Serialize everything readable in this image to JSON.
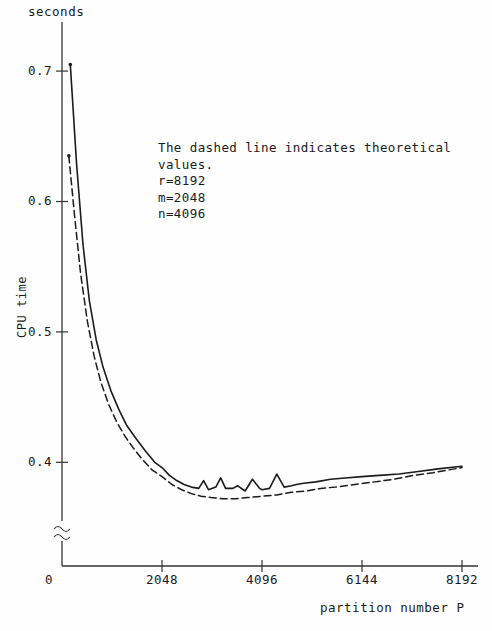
{
  "figure": {
    "units_label": "seconds",
    "ylabel": "CPU time",
    "xlabel": "partition number P",
    "annotation_lines": [
      "The dashed line indicates theoretical",
      "values.",
      "r=8192",
      "m=2048",
      "n=4096"
    ],
    "axis_break_symbol": "≈",
    "line_color": "#1a1a1a"
  },
  "chart_data": {
    "type": "line",
    "title": "",
    "subtitle": "",
    "xlabel": "partition number P",
    "ylabel": "CPU time",
    "units": "seconds",
    "xlim": [
      0,
      8192
    ],
    "ylim": [
      0.355,
      0.72
    ],
    "y_axis_break": true,
    "y_axis_break_note": "axis broken between 0 and ~0.36",
    "xticks": [
      0,
      2048,
      4096,
      6144,
      8192
    ],
    "xtick_labels": [
      "0",
      "2048",
      "4096",
      "6144",
      "8192"
    ],
    "yticks": [
      0.4,
      0.5,
      0.6,
      0.7
    ],
    "ytick_labels": [
      "0.4",
      "0.5",
      "0.6",
      "0.7"
    ],
    "grid": false,
    "legend": false,
    "annotation": "The dashed line indicates theoretical values. r=8192, m=2048, n=4096",
    "series": [
      {
        "name": "measured",
        "style": "solid",
        "x": [
          170,
          300,
          430,
          560,
          700,
          840,
          1000,
          1170,
          1330,
          1500,
          1700,
          1900,
          2048,
          2200,
          2350,
          2500,
          2650,
          2800,
          2900,
          3000,
          3150,
          3250,
          3350,
          3500,
          3600,
          3750,
          3900,
          4050,
          4096,
          4250,
          4400,
          4550,
          4700,
          4800,
          4950,
          5200,
          5500,
          5800,
          6144,
          6500,
          6900,
          7300,
          7700,
          8192
        ],
        "y": [
          0.705,
          0.628,
          0.567,
          0.524,
          0.494,
          0.473,
          0.455,
          0.44,
          0.428,
          0.419,
          0.409,
          0.4,
          0.396,
          0.39,
          0.386,
          0.383,
          0.381,
          0.38,
          0.386,
          0.379,
          0.381,
          0.388,
          0.38,
          0.38,
          0.382,
          0.378,
          0.387,
          0.38,
          0.379,
          0.38,
          0.391,
          0.381,
          0.382,
          0.383,
          0.384,
          0.385,
          0.387,
          0.388,
          0.389,
          0.39,
          0.391,
          0.393,
          0.395,
          0.397
        ]
      },
      {
        "name": "theoretical",
        "style": "dashed",
        "x": [
          140,
          260,
          380,
          520,
          660,
          800,
          960,
          1120,
          1290,
          1460,
          1650,
          1850,
          2048,
          2250,
          2450,
          2650,
          2850,
          3050,
          3300,
          3550,
          3800,
          4096,
          4400,
          4700,
          5000,
          5300,
          5600,
          6000,
          6400,
          6800,
          7200,
          7600,
          8192
        ],
        "y": [
          0.635,
          0.588,
          0.545,
          0.508,
          0.481,
          0.461,
          0.444,
          0.431,
          0.42,
          0.411,
          0.402,
          0.394,
          0.389,
          0.383,
          0.379,
          0.376,
          0.374,
          0.373,
          0.372,
          0.372,
          0.373,
          0.374,
          0.375,
          0.377,
          0.378,
          0.38,
          0.381,
          0.383,
          0.385,
          0.387,
          0.39,
          0.392,
          0.396
        ]
      }
    ]
  }
}
